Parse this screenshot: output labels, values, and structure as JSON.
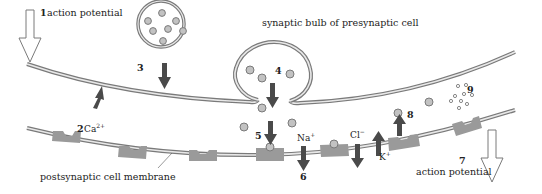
{
  "diagram": {
    "labels": {
      "step1": {
        "number": "1",
        "text": "action potential"
      },
      "step2": {
        "number": "2",
        "text": "Ca",
        "sup": "2+"
      },
      "step3": {
        "number": "3"
      },
      "step4": {
        "number": "4"
      },
      "step5": {
        "number": "5"
      },
      "step6": {
        "number": "6"
      },
      "step7": {
        "number": "7",
        "text": "action potential"
      },
      "step8": {
        "number": "8"
      },
      "step9": {
        "number": "9"
      },
      "presynaptic": "synaptic bulb of presynaptic cell",
      "postsynaptic": "postsynaptic cell membrane",
      "na": {
        "text": "Na",
        "sup": "+"
      },
      "cl": {
        "text": "Cl",
        "sup": "−"
      },
      "k": {
        "text": "K",
        "sup": "+"
      }
    },
    "colors": {
      "membrane": "#7a7a7a",
      "vesicle_fill": "#c2c2c2",
      "receptor": "#9a9a9a",
      "arrow": "#4a4a4a"
    }
  }
}
